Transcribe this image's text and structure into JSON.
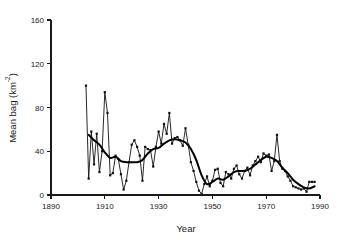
{
  "chart_data": {
    "type": "line",
    "title": "",
    "xlabel": "Year",
    "ylabel": "Mean bag (km-2)",
    "ylabel_base": "Mean bag (km",
    "ylabel_exponent": "-2",
    "ylabel_tail": ")",
    "xlim": [
      1890,
      1990
    ],
    "ylim": [
      0,
      160
    ],
    "xticks": [
      1890,
      1910,
      1930,
      1950,
      1970,
      1990
    ],
    "xticklabels": [
      "1890",
      "1910",
      "1930",
      "1950",
      "1970",
      "1990"
    ],
    "yticks": [
      0,
      40,
      80,
      120,
      160
    ],
    "yticklabels": [
      "0",
      "40",
      "80",
      "120",
      "160"
    ],
    "grid": false,
    "legend": null,
    "series": [
      {
        "name": "Annual mean bag",
        "style": "line-with-square-markers",
        "color": "#111111",
        "x": [
          1903,
          1904,
          1905,
          1906,
          1907,
          1908,
          1909,
          1910,
          1911,
          1912,
          1913,
          1914,
          1915,
          1916,
          1917,
          1918,
          1919,
          1920,
          1921,
          1922,
          1923,
          1924,
          1925,
          1926,
          1927,
          1928,
          1929,
          1930,
          1931,
          1932,
          1933,
          1934,
          1935,
          1936,
          1937,
          1938,
          1939,
          1940,
          1941,
          1942,
          1943,
          1944,
          1945,
          1946,
          1947,
          1948,
          1949,
          1950,
          1951,
          1952,
          1953,
          1954,
          1955,
          1956,
          1957,
          1958,
          1959,
          1960,
          1961,
          1962,
          1963,
          1964,
          1965,
          1966,
          1967,
          1968,
          1969,
          1970,
          1971,
          1972,
          1973,
          1974,
          1975,
          1976,
          1977,
          1978,
          1979,
          1980,
          1981,
          1982,
          1983,
          1984,
          1985,
          1986,
          1987,
          1988
        ],
        "y": [
          100,
          15,
          58,
          28,
          56,
          21,
          40,
          94,
          75,
          18,
          20,
          36,
          33,
          19,
          5,
          13,
          30,
          46,
          50,
          44,
          36,
          13,
          44,
          42,
          41,
          26,
          44,
          58,
          47,
          65,
          56,
          75,
          47,
          52,
          53,
          50,
          45,
          61,
          46,
          30,
          22,
          12,
          4,
          1,
          10,
          17,
          8,
          13,
          23,
          24,
          11,
          8,
          21,
          19,
          15,
          24,
          27,
          19,
          15,
          22,
          25,
          18,
          27,
          31,
          35,
          30,
          38,
          36,
          37,
          22,
          31,
          55,
          31,
          24,
          22,
          17,
          13,
          8,
          7,
          6,
          5,
          6,
          3,
          12,
          12,
          12
        ]
      },
      {
        "name": "Smoothed trend",
        "style": "thick-line",
        "color": "#000000",
        "x": [
          1904,
          1906,
          1908,
          1910,
          1912,
          1914,
          1916,
          1918,
          1920,
          1922,
          1924,
          1926,
          1928,
          1930,
          1932,
          1934,
          1936,
          1938,
          1940,
          1942,
          1944,
          1946,
          1948,
          1950,
          1952,
          1954,
          1956,
          1958,
          1960,
          1962,
          1964,
          1966,
          1968,
          1970,
          1972,
          1974,
          1976,
          1978,
          1980,
          1982,
          1984,
          1986,
          1988
        ],
        "y": [
          55,
          50,
          46,
          39,
          34,
          35,
          31,
          30,
          30,
          30,
          32,
          38,
          42,
          43,
          47,
          50,
          51,
          50,
          48,
          42,
          32,
          18,
          10,
          12,
          15,
          14,
          17,
          21,
          22,
          22,
          24,
          28,
          32,
          35,
          34,
          31,
          25,
          20,
          14,
          10,
          7,
          6,
          8
        ]
      }
    ]
  }
}
